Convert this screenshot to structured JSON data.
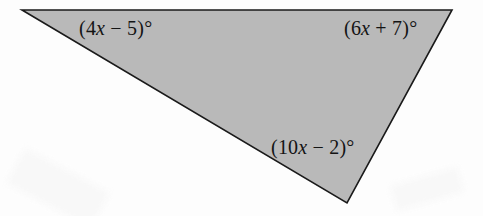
{
  "figure": {
    "kind": "geometry-diagram",
    "shape": "triangle",
    "fill_color": "#b9b9b9",
    "stroke_color": "#1a1a1a",
    "background_color": "#fdfdfd",
    "stroke_width": 1.6,
    "width": 483,
    "height": 216,
    "vertices": {
      "top_left": {
        "x": 22,
        "y": 10
      },
      "top_right": {
        "x": 452,
        "y": 10
      },
      "bottom": {
        "x": 347,
        "y": 203
      }
    },
    "polygon_points": "22,10 452,10 347,203"
  },
  "labels": {
    "top_left": {
      "open_paren": "(",
      "coefficient": "4",
      "variable": "x",
      "operator": " − ",
      "constant": "5",
      "close_paren": ")",
      "degree": "°",
      "full_text": "(4x − 5)°"
    },
    "top_right": {
      "open_paren": "(",
      "coefficient": "6",
      "variable": "x",
      "operator": " + ",
      "constant": "7",
      "close_paren": ")",
      "degree": "°",
      "full_text": "(6x + 7)°"
    },
    "bottom": {
      "open_paren": "(",
      "coefficient": "10",
      "variable": "x",
      "operator": " − ",
      "constant": "2",
      "close_paren": ")",
      "degree": "°",
      "full_text": "(10x − 2)°"
    }
  }
}
